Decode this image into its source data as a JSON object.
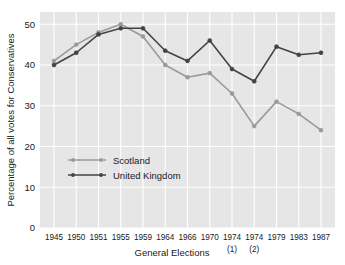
{
  "chart_data": {
    "type": "line",
    "title": "",
    "xlabel": "General Elections",
    "ylabel": "Percentage of all votes for Conservatives",
    "categories": [
      "1945",
      "1950",
      "1951",
      "1955",
      "1959",
      "1964",
      "1966",
      "1970",
      "1974",
      "1974",
      "1979",
      "1983",
      "1987"
    ],
    "category_sublabels": [
      "",
      "",
      "",
      "",
      "",
      "",
      "",
      "",
      "(1)",
      "(2)",
      "",
      "",
      ""
    ],
    "ylim": [
      0,
      53
    ],
    "yticks": [
      0,
      10,
      20,
      30,
      40,
      50
    ],
    "ytick_labels": [
      "0",
      "10",
      "20",
      "30",
      "40",
      "50"
    ],
    "grid": true,
    "legend_position": "center-left",
    "series": [
      {
        "name": "Scotland",
        "color": "#9a9a9a",
        "values": [
          41.0,
          45.0,
          48.0,
          50.0,
          47.0,
          40.0,
          37.0,
          38.0,
          33.0,
          25.0,
          31.0,
          28.0,
          24.0
        ]
      },
      {
        "name": "United Kingdom",
        "color": "#434343",
        "values": [
          40.0,
          43.0,
          47.5,
          49.0,
          49.0,
          43.5,
          41.0,
          46.0,
          39.0,
          36.0,
          44.5,
          42.5,
          43.0
        ]
      }
    ],
    "style": {
      "plot_background": "#e6e6e6",
      "grid_color": "#ffffff",
      "figure_background": "#ffffff",
      "axis_text_color": "#1a1a1a"
    }
  }
}
